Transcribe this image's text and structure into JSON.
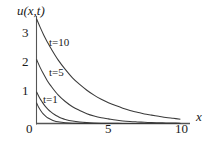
{
  "figure": {
    "name": "heat-equation-decay-plot",
    "background": "#ffffff",
    "ink_color": "#3a3a3a",
    "text_color": "#1a1a1a"
  },
  "axes": {
    "y_axis_label": "u(x,t)",
    "x_axis_label": "x",
    "x_ticks": [
      "0",
      "5",
      "10"
    ],
    "y_ticks": [
      "1",
      "2",
      "3"
    ],
    "origin_label": "0"
  },
  "curve_labels": {
    "t10": "t=10",
    "t5": "t=5",
    "t1": "t=1"
  },
  "chart_data": {
    "type": "line",
    "title": "",
    "xlabel": "x",
    "ylabel": "u(x,t)",
    "xlim": [
      0,
      10.6
    ],
    "ylim": [
      0,
      3.75
    ],
    "xticks": [
      0,
      5,
      10
    ],
    "yticks": [
      1,
      2,
      3
    ],
    "grid": false,
    "legend": "inline-curve-labels",
    "annotations": [
      {
        "text": "t=10",
        "x": 1.55,
        "y": 2.62
      },
      {
        "text": "t=5",
        "x": 1.55,
        "y": 1.62
      },
      {
        "text": "t=1",
        "x": 0.95,
        "y": 0.72
      }
    ],
    "series": [
      {
        "name": "t=10",
        "x": [
          0,
          0.25,
          0.5,
          0.75,
          1,
          1.5,
          2,
          2.5,
          3,
          3.5,
          4,
          4.5,
          5,
          5.5,
          6,
          6.5,
          7,
          7.5,
          8,
          8.5,
          9,
          9.5,
          10
        ],
        "values": [
          3.62,
          3.33,
          3.06,
          2.82,
          2.6,
          2.2,
          1.87,
          1.58,
          1.35,
          1.15,
          0.98,
          0.84,
          0.72,
          0.62,
          0.53,
          0.45,
          0.39,
          0.33,
          0.29,
          0.25,
          0.21,
          0.18,
          0.15
        ]
      },
      {
        "name": "t=5",
        "x": [
          0,
          0.25,
          0.5,
          0.75,
          1,
          1.5,
          2,
          2.5,
          3,
          3.5,
          4,
          4.5,
          5,
          5.5,
          6,
          6.5,
          7,
          7.5,
          8,
          8.5,
          9,
          9.5,
          10
        ],
        "values": [
          2.22,
          1.94,
          1.7,
          1.48,
          1.3,
          0.99,
          0.76,
          0.58,
          0.45,
          0.34,
          0.26,
          0.2,
          0.16,
          0.12,
          0.09,
          0.07,
          0.055,
          0.042,
          0.032,
          0.025,
          0.019,
          0.015,
          0.012
        ]
      },
      {
        "name": "t=1",
        "x": [
          0,
          0.2,
          0.4,
          0.6,
          0.8,
          1,
          1.25,
          1.5,
          1.75,
          2,
          2.5,
          3,
          3.5,
          4,
          4.5,
          5,
          6,
          7,
          8,
          9,
          10
        ],
        "values": [
          1.1,
          0.9,
          0.74,
          0.6,
          0.49,
          0.4,
          0.31,
          0.24,
          0.18,
          0.14,
          0.085,
          0.05,
          0.03,
          0.018,
          0.011,
          0.007,
          0.003,
          0.001,
          0.0005,
          0.0002,
          0.0001
        ]
      },
      {
        "name": "t=0.5",
        "x": [
          0,
          0.15,
          0.3,
          0.45,
          0.6,
          0.8,
          1,
          1.25,
          1.5,
          1.75,
          2,
          2.5,
          3,
          3.5,
          4,
          5,
          6,
          7,
          8,
          9,
          10
        ],
        "values": [
          0.72,
          0.56,
          0.44,
          0.34,
          0.27,
          0.19,
          0.14,
          0.09,
          0.06,
          0.04,
          0.027,
          0.012,
          0.005,
          0.002,
          0.001,
          0.0003,
          0.0001,
          5e-05,
          2e-05,
          1e-05,
          5e-06
        ]
      }
    ]
  }
}
